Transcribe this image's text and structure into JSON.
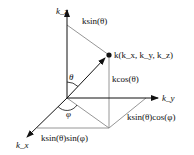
{
  "diagram": {
    "axes": {
      "z": "k_z",
      "y": "k_y",
      "x": "k_x"
    },
    "labels": {
      "vector": "k(k_x, k_y, k_z)",
      "top_projection": "ksin(θ)",
      "vertical_component": "kcos(θ)",
      "y_component": "ksin(θ)cos(φ)",
      "x_component": "ksin(θ)sin(φ)",
      "theta": "θ",
      "phi": "φ"
    },
    "colors": {
      "axis": "#111111",
      "guide": "#888888"
    }
  }
}
